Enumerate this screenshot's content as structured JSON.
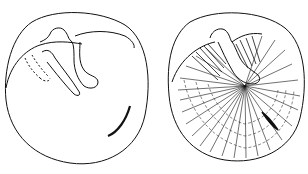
{
  "figure": {
    "panels": [
      {
        "id": "left",
        "label": "outline drawing",
        "style": "contour"
      },
      {
        "id": "right",
        "label": "shaded drawing",
        "style": "hatched"
      }
    ],
    "colors": {
      "ink": "#111111",
      "background": "#ffffff"
    }
  }
}
